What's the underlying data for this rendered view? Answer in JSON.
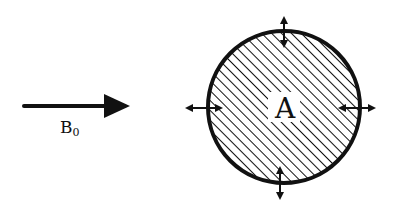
{
  "diagram": {
    "field_label": "B",
    "field_subscript": "0",
    "region_label": "A",
    "colors": {
      "stroke": "#111111",
      "background": "#ffffff",
      "hatch": "#111111"
    },
    "field_arrow": {
      "x1": 24,
      "y1": 106,
      "x2": 130,
      "y2": 106
    },
    "circle": {
      "cx": 284,
      "cy": 107,
      "r": 76,
      "fill": "diagonal-hatch"
    },
    "boundary_arrows": [
      {
        "position": "top",
        "direction": "vertical",
        "type": "double-headed"
      },
      {
        "position": "bottom",
        "direction": "vertical",
        "type": "double-headed"
      },
      {
        "position": "left",
        "direction": "horizontal",
        "type": "double-headed"
      },
      {
        "position": "right",
        "direction": "horizontal",
        "type": "double-headed"
      }
    ]
  }
}
